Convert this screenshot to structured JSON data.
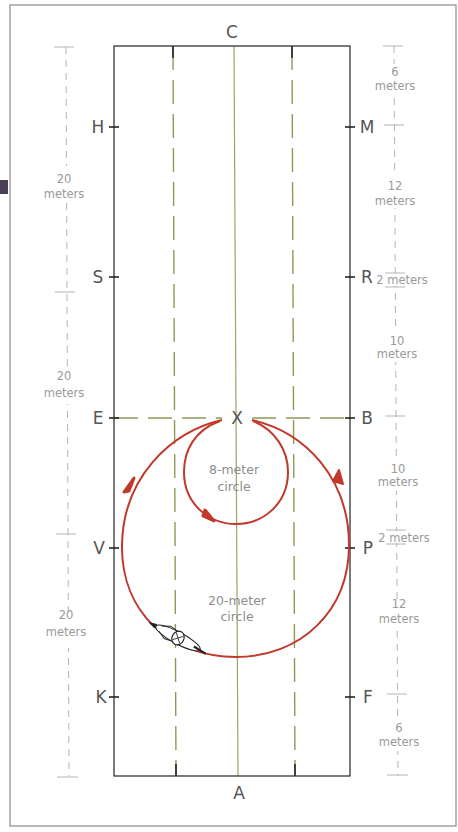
{
  "figure": {
    "type": "dressage-arena-diagram",
    "arena_letters": {
      "top": "C",
      "bottom": "A",
      "center": "X",
      "left": [
        "H",
        "S",
        "E",
        "V",
        "K"
      ],
      "right": [
        "M",
        "R",
        "B",
        "P",
        "F"
      ]
    },
    "left_dimensions": [
      {
        "value": "20",
        "unit": "meters"
      },
      {
        "value": "20",
        "unit": "meters"
      },
      {
        "value": "20",
        "unit": "meters"
      }
    ],
    "right_dimensions": [
      {
        "value": "6",
        "unit": "meters"
      },
      {
        "value": "12",
        "unit": "meters"
      },
      {
        "value": "2 meters",
        "unit": ""
      },
      {
        "value": "10",
        "unit": "meters"
      },
      {
        "value": "10",
        "unit": "meters"
      },
      {
        "value": "2 meters",
        "unit": ""
      },
      {
        "value": "12",
        "unit": "meters"
      },
      {
        "value": "6",
        "unit": "meters"
      }
    ],
    "circles": [
      {
        "label_line1": "8-meter",
        "label_line2": "circle",
        "diameter_m": 8
      },
      {
        "label_line1": "20-meter",
        "label_line2": "circle",
        "diameter_m": 20
      }
    ],
    "horse_icon": "horse-and-rider-icon",
    "colors": {
      "arena_border": "#333333",
      "center_line": "#9aa860",
      "quarter_lines": "#8d9a55",
      "path": "#c0392b",
      "dimension": "#b5b5b5",
      "dimension_text": "#9a9a9a",
      "letters": "#555555",
      "frame": "#8a8a8a",
      "tab": "#4a3f55"
    }
  }
}
